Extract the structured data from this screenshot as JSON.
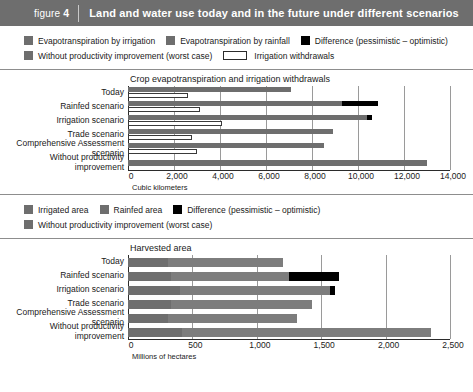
{
  "header": {
    "figure_prefix": "figure",
    "figure_number": "4",
    "title": "Land and water use today and in the future under different scenarios",
    "bg_color": "#6e6e6e"
  },
  "legend_top": {
    "row1": [
      {
        "label": "Evapotranspiration by irrigation",
        "swatch": "gray",
        "color": "#6e6e6e"
      },
      {
        "label": "Evapotranspiration by rainfall",
        "swatch": "gray",
        "color": "#6e6e6e"
      },
      {
        "label": "Difference (pessimistic – optimistic)",
        "swatch": "black",
        "color": "#000000"
      }
    ],
    "row2": [
      {
        "label": "Without productivity improvement (worst case)",
        "swatch": "gray",
        "color": "#6e6e6e"
      },
      {
        "label": "Irrigation withdrawals",
        "swatch": "hollow",
        "color": "#ffffff"
      }
    ]
  },
  "legend_bottom": {
    "row1": [
      {
        "label": "Irrigated area",
        "swatch": "gray",
        "color": "#6e6e6e"
      },
      {
        "label": "Rainfed area",
        "swatch": "gray",
        "color": "#6e6e6e"
      },
      {
        "label": "Difference (pessimistic – optimistic)",
        "swatch": "black",
        "color": "#000000"
      }
    ],
    "row2": [
      {
        "label": "Without productivity improvement (worst case)",
        "swatch": "gray",
        "color": "#6e6e6e"
      }
    ]
  },
  "chart_data": [
    {
      "type": "bar",
      "orientation": "horizontal",
      "title": "Crop evapotranspiration and irrigation withdrawals",
      "xlabel": "Cubic kilometers",
      "ylabel": "",
      "xlim": [
        0,
        14000
      ],
      "xticks": [
        0,
        2000,
        4000,
        6000,
        8000,
        10000,
        12000,
        14000
      ],
      "xtick_labels": [
        "0",
        "2,000",
        "4,000",
        "6,000",
        "8,000",
        "10,000",
        "12,000",
        "14,000"
      ],
      "grid": true,
      "categories": [
        "Today",
        "Rainfed scenario",
        "Irrigation scenario",
        "Trade scenario",
        "Comprehensive Assessment scenario",
        "Without productivity improvement"
      ],
      "series": [
        {
          "name": "Evapotranspiration (total)",
          "values": [
            7100,
            9300,
            10400,
            8900,
            8500,
            13000
          ]
        },
        {
          "name": "Difference (pessimistic – optimistic)",
          "values": [
            0,
            1550,
            200,
            0,
            0,
            0
          ]
        },
        {
          "name": "Irrigation withdrawals",
          "values": [
            2600,
            3150,
            4100,
            2800,
            3000,
            null
          ]
        }
      ]
    },
    {
      "type": "bar",
      "orientation": "horizontal",
      "title": "Harvested area",
      "xlabel": "Millions of hectares",
      "ylabel": "",
      "xlim": [
        0,
        2500
      ],
      "xticks": [
        0,
        500,
        1000,
        1500,
        2000,
        2500
      ],
      "xtick_labels": [
        "0",
        "500",
        "1,000",
        "1,500",
        "2,000",
        "2,500"
      ],
      "grid": true,
      "categories": [
        "Today",
        "Rainfed scenario",
        "Irrigation scenario",
        "Trade scenario",
        "Comprehensive Assessment scenario",
        "Without productivity improvement"
      ],
      "series": [
        {
          "name": "Irrigated area",
          "values": [
            310,
            330,
            400,
            330,
            310,
            420
          ]
        },
        {
          "name": "Rainfed area",
          "values": [
            890,
            920,
            1170,
            1100,
            1000,
            1930
          ]
        },
        {
          "name": "Difference (pessimistic – optimistic)",
          "values": [
            0,
            390,
            40,
            0,
            0,
            0
          ]
        }
      ]
    }
  ]
}
